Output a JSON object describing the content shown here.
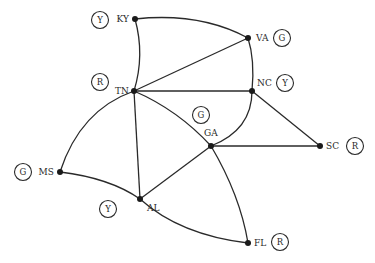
{
  "diagram": {
    "type": "graph-coloring-map",
    "nodes": [
      {
        "id": "KY",
        "label": "KY",
        "color_label": "Y"
      },
      {
        "id": "VA",
        "label": "VA",
        "color_label": "G"
      },
      {
        "id": "TN",
        "label": "TN",
        "color_label": "R"
      },
      {
        "id": "NC",
        "label": "NC",
        "color_label": "Y"
      },
      {
        "id": "GA",
        "label": "GA",
        "color_label": "G"
      },
      {
        "id": "SC",
        "label": "SC",
        "color_label": "R"
      },
      {
        "id": "MS",
        "label": "MS",
        "color_label": "G"
      },
      {
        "id": "AL",
        "label": "AL",
        "color_label": "Y"
      },
      {
        "id": "FL",
        "label": "FL",
        "color_label": "R"
      }
    ],
    "edges": [
      [
        "KY",
        "VA"
      ],
      [
        "KY",
        "TN"
      ],
      [
        "TN",
        "VA"
      ],
      [
        "VA",
        "NC"
      ],
      [
        "TN",
        "NC"
      ],
      [
        "NC",
        "GA"
      ],
      [
        "NC",
        "SC"
      ],
      [
        "TN",
        "GA"
      ],
      [
        "GA",
        "SC"
      ],
      [
        "TN",
        "AL"
      ],
      [
        "TN",
        "MS"
      ],
      [
        "MS",
        "AL"
      ],
      [
        "AL",
        "GA"
      ],
      [
        "AL",
        "FL"
      ],
      [
        "GA",
        "FL"
      ]
    ]
  }
}
